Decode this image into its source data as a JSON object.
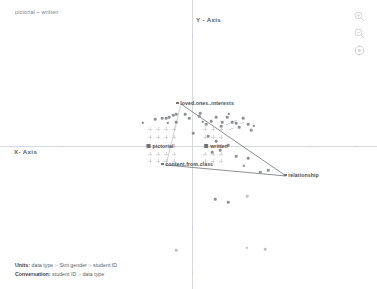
{
  "header": {
    "note": "pictorial ~ written"
  },
  "axes": {
    "x_label": "X- Axis",
    "y_label": "Y - Axis",
    "origin_x": 192,
    "origin_y": 146
  },
  "tools": [
    {
      "name": "zoom-in-icon",
      "label": "Zoom in"
    },
    {
      "name": "zoom-out-icon",
      "label": "Zoom out"
    },
    {
      "name": "reset-view-icon",
      "label": "Reset view"
    }
  ],
  "footer": {
    "line1_label": "Units:",
    "line1_value": " data type :- Stnt gender :- student ID",
    "line2_label": "Conversation:",
    "line2_value": " student ID :- data type"
  },
  "centroids": [
    {
      "name": "pictorial",
      "label": "pictorial",
      "x": 160,
      "y": 146
    },
    {
      "name": "written",
      "label": "written",
      "x": 216,
      "y": 146
    }
  ],
  "vertices": [
    {
      "name": "loved-ones-interests",
      "label": "loved.ones..interests",
      "x": 180,
      "y": 103,
      "anchor": "left"
    },
    {
      "name": "content-from-class",
      "label": "content.from.class",
      "x": 165,
      "y": 164,
      "anchor": "left"
    },
    {
      "name": "relationship",
      "label": "relationship",
      "x": 283,
      "y": 175,
      "anchor": "left"
    }
  ],
  "chart_data": {
    "type": "scatter",
    "title": "pictorial ~ written",
    "xlabel": "X- Axis",
    "ylabel": "Y - Axis",
    "grid": false,
    "legend": "none",
    "axis_origin_px": {
      "x": 192,
      "y": 146
    },
    "series": [
      {
        "name": "row-points",
        "marker": "circle",
        "color": "#8e9298",
        "points_px": [
          [
            143,
            123
          ],
          [
            155,
            119
          ],
          [
            162,
            118
          ],
          [
            166,
            118
          ],
          [
            169,
            117
          ],
          [
            173,
            115
          ],
          [
            176,
            114
          ],
          [
            168,
            123
          ],
          [
            176,
            122
          ],
          [
            185,
            114
          ],
          [
            189,
            118
          ],
          [
            193,
            133
          ],
          [
            199,
            116
          ],
          [
            200,
            113
          ],
          [
            203,
            122
          ],
          [
            206,
            124
          ],
          [
            211,
            121
          ],
          [
            216,
            117
          ],
          [
            221,
            126
          ],
          [
            222,
            122
          ],
          [
            227,
            117
          ],
          [
            229,
            114
          ],
          [
            232,
            122
          ],
          [
            236,
            123
          ],
          [
            239,
            127
          ],
          [
            243,
            118
          ],
          [
            248,
            124
          ],
          [
            251,
            130
          ],
          [
            254,
            126
          ],
          [
            208,
            136
          ],
          [
            216,
            141
          ],
          [
            212,
            152
          ],
          [
            220,
            150
          ],
          [
            228,
            145
          ],
          [
            236,
            156
          ],
          [
            244,
            166
          ],
          [
            248,
            158
          ],
          [
            260,
            172
          ],
          [
            268,
            170
          ],
          [
            215,
            199
          ],
          [
            228,
            202
          ],
          [
            247,
            196
          ],
          [
            247,
            248
          ],
          [
            265,
            249
          ],
          [
            176,
            250
          ]
        ]
      },
      {
        "name": "cross-grid-markers",
        "marker": "plus",
        "color": "#b6bac0",
        "points_px": [
          [
            150,
            129
          ],
          [
            158,
            129
          ],
          [
            166,
            129
          ],
          [
            174,
            129
          ],
          [
            150,
            137
          ],
          [
            158,
            137
          ],
          [
            166,
            137
          ],
          [
            174,
            137
          ],
          [
            150,
            146
          ],
          [
            174,
            146
          ],
          [
            150,
            154
          ],
          [
            158,
            154
          ],
          [
            166,
            154
          ],
          [
            174,
            154
          ],
          [
            150,
            161
          ],
          [
            158,
            161
          ],
          [
            166,
            161
          ],
          [
            174,
            161
          ],
          [
            205,
            129
          ],
          [
            213,
            129
          ],
          [
            221,
            129
          ],
          [
            205,
            137
          ],
          [
            213,
            137
          ],
          [
            221,
            137
          ],
          [
            205,
            146
          ],
          [
            221,
            146
          ],
          [
            205,
            154
          ],
          [
            213,
            154
          ],
          [
            221,
            154
          ],
          [
            205,
            161
          ],
          [
            213,
            161
          ],
          [
            221,
            161
          ]
        ]
      }
    ],
    "hull_paths": [
      {
        "name": "upper-hull",
        "points_px": [
          [
            181,
            104
          ],
          [
            286,
            176
          ]
        ]
      },
      {
        "name": "lower-hull",
        "points_px": [
          [
            166,
            165
          ],
          [
            286,
            176
          ]
        ]
      },
      {
        "name": "left-hull",
        "points_px": [
          [
            166,
            165
          ],
          [
            181,
            104
          ]
        ]
      }
    ],
    "annotations": [
      {
        "text": "loved.ones..interests",
        "x": 180,
        "y": 103
      },
      {
        "text": "content.from.class",
        "x": 165,
        "y": 164
      },
      {
        "text": "relationship",
        "x": 283,
        "y": 175
      },
      {
        "text": "pictorial",
        "x": 160,
        "y": 146
      },
      {
        "text": "written",
        "x": 216,
        "y": 146
      }
    ]
  }
}
